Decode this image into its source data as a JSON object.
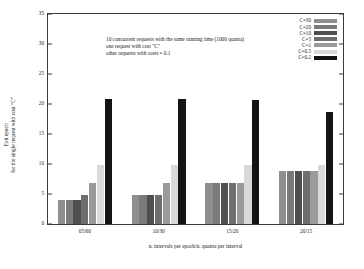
{
  "chart_data": {
    "type": "bar",
    "title": "",
    "xlabel": "n. intervals per epoch/n. quanta per interval",
    "ylabel_lines": [
      "Exit epoch",
      "for the single request with cost \"C\""
    ],
    "categories": [
      "05/60",
      "10/30",
      "15/20",
      "20/15"
    ],
    "ylim": [
      0,
      35
    ],
    "yticks": [
      0,
      5,
      10,
      15,
      20,
      25,
      30,
      35
    ],
    "grid": false,
    "legend_position": "top-right",
    "series": [
      {
        "name": "C=30",
        "color": "#8f8f8f",
        "values": [
          4.0,
          4.9,
          6.8,
          8.8
        ]
      },
      {
        "name": "C=20",
        "color": "#7a7a7a",
        "values": [
          4.0,
          4.9,
          6.8,
          8.8
        ]
      },
      {
        "name": "C=10",
        "color": "#4f4f4f",
        "values": [
          4.0,
          4.9,
          6.8,
          8.8
        ]
      },
      {
        "name": "C=5",
        "color": "#6e6e6e",
        "values": [
          4.9,
          4.9,
          6.8,
          8.8
        ]
      },
      {
        "name": "C=1",
        "color": "#9a9a9a",
        "values": [
          6.9,
          6.8,
          6.8,
          8.8
        ]
      },
      {
        "name": "C=0.5",
        "color": "#d9d9d9",
        "values": [
          9.8,
          9.8,
          9.8,
          9.8
        ]
      },
      {
        "name": "C=0.2",
        "color": "#141414",
        "values": [
          20.9,
          20.8,
          20.7,
          18.7
        ]
      }
    ],
    "annotation_lines": [
      "10 concurrent requests with the same running time (1000 quanta)",
      "one request with cost \"C\"",
      "other requests with costs = 0.1"
    ]
  }
}
